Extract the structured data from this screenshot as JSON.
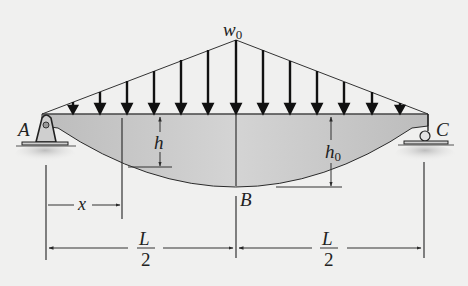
{
  "figure": {
    "labels": {
      "load_intensity": "w",
      "load_intensity_sub": "0",
      "support_left": "A",
      "support_right": "C",
      "midpoint": "B",
      "depth": "h",
      "depth_mid": "h",
      "depth_mid_sub": "0",
      "position": "x",
      "half_span_num": "L",
      "half_span_den": "2"
    },
    "colors": {
      "background": "#f0f0ef",
      "beam_fill": "#bdbdbd",
      "beam_fill_light": "#d6d6d6",
      "line": "#2a2a2a",
      "ground": "#c8c8c8"
    }
  }
}
